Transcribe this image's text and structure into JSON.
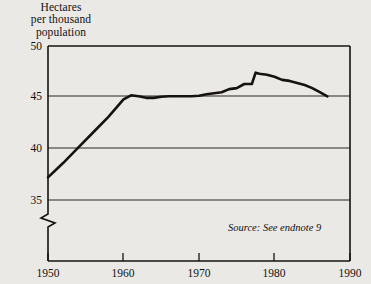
{
  "chart_data": {
    "type": "line",
    "title": "Hectares\nper thousand\npopulation",
    "title_lines": [
      "Hectares",
      "per thousand",
      "population"
    ],
    "xlabel": "",
    "ylabel": "Hectares per thousand population",
    "xlim": [
      1950,
      1990
    ],
    "ylim": [
      35,
      50
    ],
    "y_axis_break_below": 35,
    "grid": true,
    "grid_orientation": "horizontal",
    "legend": false,
    "line_color": "#16120f",
    "background_color": "#ebe9e6",
    "frame_color": "#16120f",
    "yticks": [
      35,
      40,
      45,
      50
    ],
    "ytick_labels": [
      "35",
      "40",
      "45",
      "50"
    ],
    "xticks": [
      1950,
      1960,
      1970,
      1980,
      1990
    ],
    "xtick_labels": [
      "1950",
      "1960",
      "1970",
      "1980",
      "1990"
    ],
    "annotation": "Source: See endnote 9",
    "series": [
      {
        "name": "Cropland area per thousand population",
        "x": [
          1950,
          1952,
          1954,
          1956,
          1958,
          1960,
          1961,
          1962,
          1963,
          1964,
          1965,
          1966,
          1967,
          1968,
          1969,
          1970,
          1971,
          1972,
          1973,
          1974,
          1975,
          1976,
          1977,
          1977.5,
          1978,
          1979,
          1980,
          1981,
          1982,
          1983,
          1984,
          1985,
          1986,
          1987
        ],
        "values": [
          37.2,
          38.6,
          40.1,
          41.6,
          43.1,
          44.8,
          45.2,
          45.1,
          44.95,
          44.95,
          45.05,
          45.1,
          45.1,
          45.1,
          45.1,
          45.15,
          45.3,
          45.4,
          45.5,
          45.8,
          45.9,
          46.3,
          46.3,
          47.4,
          47.3,
          47.2,
          47.0,
          46.7,
          46.6,
          46.4,
          46.2,
          45.9,
          45.5,
          45.1
        ]
      }
    ]
  },
  "geometry": {
    "plot_left": 48,
    "plot_right": 350,
    "plot_top": 46,
    "plot_bottom_frame": 209,
    "axis_line_y": 261,
    "y_for_50": 46,
    "y_for_45": 96,
    "y_for_40": 148,
    "y_for_35": 200
  }
}
